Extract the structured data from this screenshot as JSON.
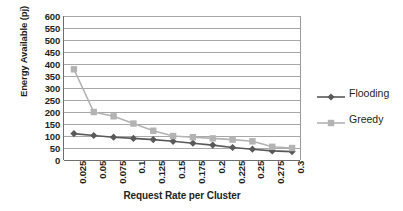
{
  "chart_data": {
    "type": "line",
    "title": "",
    "xlabel": "Request Rate per Cluster",
    "ylabel": "Energy Available (pj)",
    "categories": [
      "0.025",
      "0.05",
      "0.075",
      "0.1",
      "0.125",
      "0.15",
      "0.175",
      "0.2",
      "0.225",
      "0.25",
      "0.275",
      "0.3"
    ],
    "ylim": [
      0,
      600
    ],
    "yticks": [
      600,
      550,
      500,
      450,
      400,
      350,
      300,
      250,
      200,
      150,
      100,
      50,
      0
    ],
    "grid": true,
    "legend_position": "right",
    "series": [
      {
        "name": "Flooding",
        "color": "#595959",
        "marker": "diamond",
        "values": [
          110,
          102,
          95,
          90,
          85,
          78,
          70,
          62,
          52,
          45,
          38,
          35
        ]
      },
      {
        "name": "Greedy",
        "color": "#b3b3b3",
        "marker": "square",
        "values": [
          378,
          200,
          182,
          152,
          122,
          100,
          95,
          90,
          85,
          78,
          55,
          50
        ]
      }
    ]
  },
  "axis": {
    "y_title": "Energy Available (pj)",
    "x_title": "Request Rate per Cluster",
    "y_tick_labels": [
      "600",
      "550",
      "500",
      "450",
      "400",
      "350",
      "300",
      "250",
      "200",
      "150",
      "100",
      "50",
      "0"
    ],
    "x_tick_labels": [
      "0.025",
      "0.05",
      "0.075",
      "0.1",
      "0.125",
      "0.15",
      "0.175",
      "0.2",
      "0.225",
      "0.25",
      "0.275",
      "0.3"
    ]
  },
  "legend": {
    "items": [
      {
        "label": "Flooding",
        "color": "#595959",
        "marker": "diamond"
      },
      {
        "label": "Greedy",
        "color": "#b3b3b3",
        "marker": "square"
      }
    ]
  }
}
